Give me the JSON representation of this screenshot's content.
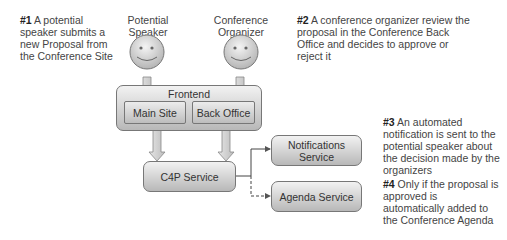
{
  "notes": [
    {
      "num": "#1",
      "text": " A potential speaker submits a new Proposal from the Conference Site"
    },
    {
      "num": "#2",
      "text": " A conference organizer review the proposal in the Conference Back Office and decides to approve or reject it"
    },
    {
      "num": "#3",
      "text": " An automated notification is sent to the potential speaker about the decision made by the organizers"
    },
    {
      "num": "#4",
      "text": " Only if the proposal is approved is automatically added to the Conference Agenda page"
    }
  ],
  "actors": [
    {
      "line1": "Potential",
      "line2": "Speaker"
    },
    {
      "line1": "Conference",
      "line2": "Organizer"
    }
  ],
  "frontend": {
    "title": "Frontend",
    "main_site": "Main Site",
    "back_office": "Back Office"
  },
  "services": {
    "c4p": "C4P Service",
    "notifications_line1": "Notifications",
    "notifications_line2": "Service",
    "agenda": "Agenda Service"
  }
}
